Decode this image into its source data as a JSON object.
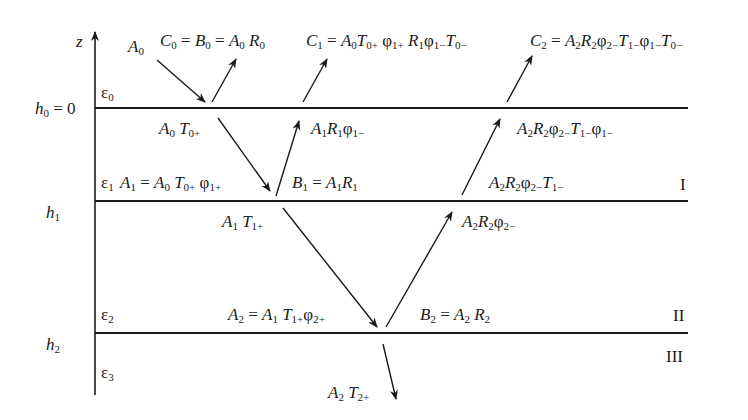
{
  "diagram": {
    "axis_label": "z",
    "interfaces": [
      {
        "label": "h0 = 0",
        "y": 108
      },
      {
        "label": "h1",
        "y": 201
      },
      {
        "label": "h2",
        "y": 333
      }
    ],
    "media": [
      "ε0",
      "ε1",
      "ε2",
      "ε3"
    ],
    "region_labels": [
      "I",
      "II",
      "III"
    ],
    "wave_labels": {
      "A0": "A0",
      "C0": "C0 = B0 = A0 R0",
      "C1": "C1 = A0 T0+ φ1+ R1 φ1− T0−",
      "C2": "C2 = A2 R2 φ2− T1− φ1− T0−",
      "A0T0": "A0 T0+",
      "A1R1phi": "A1 R1 φ1−",
      "A2R2phi2T1phi1": "A2 R2 φ2− T1− φ1−",
      "A1": "A1 = A0 T0+ φ1+",
      "B1": "B1 = A1 R1",
      "A2R2phi2T1": "A2 R2 φ2− T1−",
      "A1T1": "A1 T1+",
      "A2R2phi2": "A2 R2 φ2−",
      "A2": "A2 = A1 T1+ φ2+",
      "B2": "B2 = A2 R2",
      "A2T2": "A2 T2+"
    },
    "colors": {
      "ink": "#1a1a1a",
      "background": "#ffffff"
    }
  }
}
